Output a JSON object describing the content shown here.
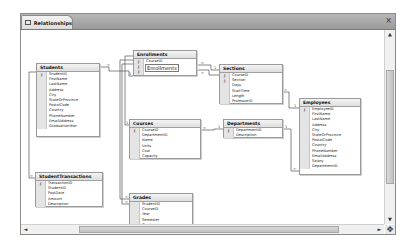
{
  "window": {
    "tab_label": "Relationships",
    "close_glyph": "×"
  },
  "scroll": {
    "up": "▲",
    "down": "▼",
    "left": "◄",
    "right": "►",
    "grip": "✥"
  },
  "key_glyph": "⚷",
  "tables": {
    "students": {
      "title": "Students",
      "fields": [
        "StudentID",
        "FirstName",
        "LastName",
        "Address",
        "City",
        "StateOrProvince",
        "PostalCode",
        "Country",
        "PhoneNumber",
        "EmailAddress",
        "GraduationYear"
      ],
      "keys": [
        0
      ]
    },
    "enrollments": {
      "title": "Enrollments",
      "fields": [
        "CourseID",
        "Section",
        "StudentID"
      ],
      "keys": [
        0,
        1,
        2
      ],
      "edit_value": "Enrollments"
    },
    "sections": {
      "title": "Sections",
      "fields": [
        "CourseID",
        "Section",
        "Days",
        "StartTime",
        "Length",
        "ProfessorID"
      ],
      "keys": [
        0,
        1
      ]
    },
    "courses": {
      "title": "Courses",
      "fields": [
        "CourseID",
        "DepartmentID",
        "Name",
        "Units",
        "Cost",
        "Capacity"
      ],
      "keys": [
        0
      ]
    },
    "departments": {
      "title": "Departments",
      "fields": [
        "DepartmentID",
        "Description"
      ],
      "keys": [
        0
      ]
    },
    "employees": {
      "title": "Employees",
      "fields": [
        "EmployeeID",
        "FirstName",
        "LastName",
        "Address",
        "City",
        "StateOrProvince",
        "PostalCode",
        "Country",
        "PhoneNumber",
        "EmailAddress",
        "Salary",
        "DepartmentID"
      ],
      "keys": [
        0
      ]
    },
    "student_transactions": {
      "title": "StudentTransactions",
      "fields": [
        "TransactionID",
        "StudentID",
        "PostDate",
        "Amount",
        "Description"
      ],
      "keys": [
        0
      ]
    },
    "grades": {
      "title": "Grades",
      "fields": [
        "StudentID",
        "CourseID",
        "Year",
        "Semester",
        "Grade"
      ],
      "keys": []
    }
  }
}
